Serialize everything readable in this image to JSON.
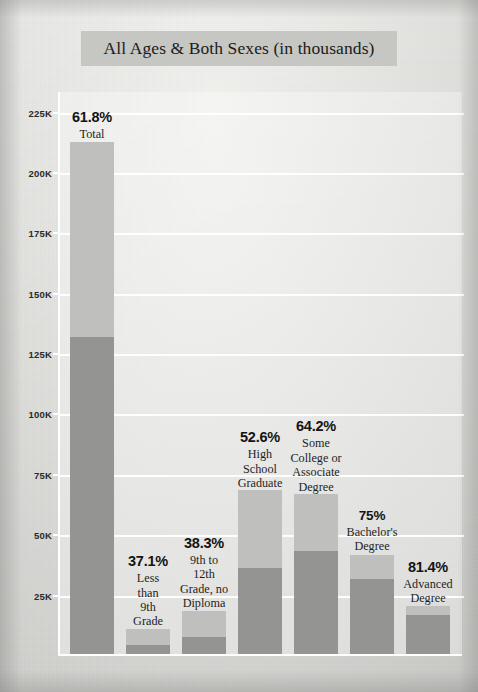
{
  "title": "All Ages & Both Sexes (in thousands)",
  "chart_data": {
    "type": "bar",
    "title": "All Ages & Both Sexes (in thousands)",
    "subtitle": "",
    "xlabel": "",
    "ylabel": "",
    "ylim": [
      0,
      225
    ],
    "yunit": "thousands",
    "grid": true,
    "legend": "none",
    "stacked": true,
    "value_label_type": "percent",
    "ytick_labels": [
      "225K",
      "200K",
      "175K",
      "150K",
      "125K",
      "100K",
      "75K",
      "50K",
      "25K"
    ],
    "ytick_values": [
      225,
      200,
      175,
      150,
      125,
      100,
      75,
      50,
      25
    ],
    "categories": [
      "Total",
      "Less than 9th Grade",
      "9th to 12th Grade, no Diploma",
      "High School Graduate",
      "Some College or Associate Degree",
      "Bachelor's Degree",
      "Advanced Degree"
    ],
    "percent_labels": [
      "61.8%",
      "37.1%",
      "38.3%",
      "52.6%",
      "64.2%",
      "75%",
      "81.4%"
    ],
    "series": [
      {
        "name": "Voted",
        "color": "#949492",
        "values": [
          131.1,
          3.9,
          6.9,
          35.6,
          42.6,
          30.9,
          16.3
        ]
      },
      {
        "name": "Did not vote",
        "color": "#bfbfbd",
        "values": [
          81.0,
          6.6,
          11.1,
          32.1,
          23.7,
          10.3,
          3.7
        ]
      }
    ],
    "totals": [
      212.1,
      10.5,
      18.0,
      67.7,
      66.3,
      41.2,
      20.0
    ]
  },
  "bars": [
    {
      "category": "Total",
      "percent": "61.8%",
      "label_lines": [
        "Total"
      ],
      "total": 212.1,
      "voted": 131.1,
      "not_voted": 81.0
    },
    {
      "category": "Less than 9th Grade",
      "percent": "37.1%",
      "label_lines": [
        "Less",
        "than",
        "9th",
        "Grade"
      ],
      "total": 10.5,
      "voted": 3.9,
      "not_voted": 6.6
    },
    {
      "category": "9th to 12th Grade, no Diploma",
      "percent": "38.3%",
      "label_lines": [
        "9th to",
        "12th",
        "Grade, no",
        "Diploma"
      ],
      "total": 18.0,
      "voted": 6.9,
      "not_voted": 11.1
    },
    {
      "category": "High School Graduate",
      "percent": "52.6%",
      "label_lines": [
        "High",
        "School",
        "Graduate"
      ],
      "total": 67.7,
      "voted": 35.6,
      "not_voted": 32.1
    },
    {
      "category": "Some College or Associate Degree",
      "percent": "64.2%",
      "label_lines": [
        "Some",
        "College or",
        "Associate",
        "Degree"
      ],
      "total": 66.3,
      "voted": 42.6,
      "not_voted": 23.7
    },
    {
      "category": "Bachelor's Degree",
      "percent": "75%",
      "label_lines": [
        "Bachelor's",
        "Degree"
      ],
      "total": 41.2,
      "voted": 30.9,
      "not_voted": 10.3
    },
    {
      "category": "Advanced Degree",
      "percent": "81.4%",
      "label_lines": [
        "Advanced",
        "Degree"
      ],
      "total": 20.0,
      "voted": 16.3,
      "not_voted": 3.7
    }
  ],
  "colors": {
    "segment_light": "#bfbfbd",
    "segment_dark": "#949492",
    "gridline": "#ffffff",
    "title_banner": "#c6c6c3",
    "page_background": "#e0e0dd"
  }
}
